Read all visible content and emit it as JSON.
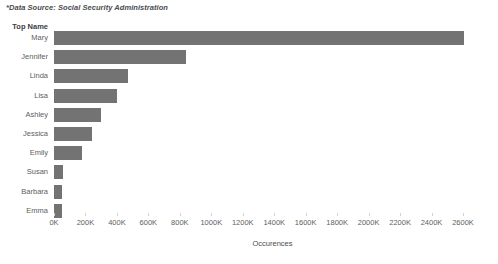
{
  "source_note": "*Data Source: Social Security Administration",
  "y_axis_header": "Top Name",
  "x_axis_title": "Occurences",
  "colors": {
    "bar": "#737373",
    "text": "#5c5e60",
    "background": "#ffffff"
  },
  "chart_data": {
    "type": "bar",
    "orientation": "horizontal",
    "title": "",
    "subtitle": "",
    "xlabel": "Occurences",
    "ylabel": "Top Name",
    "categories": [
      "Mary",
      "Jennifer",
      "Linda",
      "Lisa",
      "Ashley",
      "Jessica",
      "Emily",
      "Susan",
      "Barbara",
      "Emma"
    ],
    "values": [
      2606000,
      837000,
      473000,
      403000,
      300000,
      243000,
      179000,
      58000,
      51000,
      51000
    ],
    "xlim": [
      0,
      2600000
    ],
    "ylim": null,
    "grid": false,
    "legend": null,
    "tick_labels": [
      "0K",
      "200K",
      "400K",
      "600K",
      "800K",
      "1000K",
      "1200K",
      "1400K",
      "1600K",
      "1800K",
      "2000K",
      "2200K",
      "2400K",
      "2600K"
    ],
    "tick_values": [
      0,
      200000,
      400000,
      600000,
      800000,
      1000000,
      1200000,
      1400000,
      1600000,
      1800000,
      2000000,
      2200000,
      2400000,
      2600000
    ],
    "annotations": [
      "*Data Source: Social Security Administration"
    ]
  }
}
